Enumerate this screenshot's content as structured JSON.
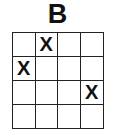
{
  "title": "B",
  "grid": {
    "rows": 4,
    "cols": 4,
    "cells": [
      [
        "",
        "X",
        "",
        ""
      ],
      [
        "X",
        "",
        "",
        ""
      ],
      [
        "",
        "",
        "",
        "X"
      ],
      [
        "",
        "",
        "",
        ""
      ]
    ]
  }
}
